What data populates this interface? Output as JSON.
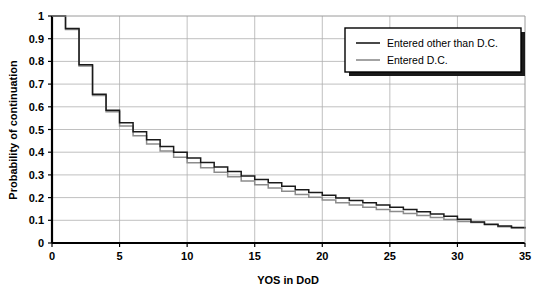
{
  "chart_data": {
    "type": "line",
    "title": "",
    "subtitle": "",
    "xlabel": "YOS in DoD",
    "ylabel": "Probability of continuation",
    "xlim": [
      0,
      35
    ],
    "ylim": [
      0,
      1
    ],
    "xticks": [
      0,
      5,
      10,
      15,
      20,
      25,
      30,
      35
    ],
    "xtick_labels": [
      "0",
      "5",
      "10",
      "15",
      "20",
      "25",
      "30",
      "35"
    ],
    "yticks": [
      0,
      0.1,
      0.2,
      0.3,
      0.4,
      0.5,
      0.6,
      0.7,
      0.8,
      0.9,
      1
    ],
    "ytick_labels": [
      "0",
      "0.1",
      "0.2",
      "0.3",
      "0.4",
      "0.5",
      "0.6",
      "0.7",
      "0.8",
      "0.9",
      "1"
    ],
    "grid": true,
    "grid_axis": "both",
    "grid_color": "#b0b0b0",
    "plot_style": "step-post",
    "legend": {
      "position": "top-right",
      "border": true,
      "shadow": true,
      "entries": [
        {
          "label": "Entered other than D.C.",
          "color": "#1a1a1a"
        },
        {
          "label": "Entered D.C.",
          "color": "#8c8c8c"
        }
      ]
    },
    "x": [
      0,
      1,
      2,
      3,
      4,
      5,
      6,
      7,
      8,
      9,
      10,
      11,
      12,
      13,
      14,
      15,
      16,
      17,
      18,
      19,
      20,
      21,
      22,
      23,
      24,
      25,
      26,
      27,
      28,
      29,
      30,
      31,
      32,
      33,
      34,
      35
    ],
    "series": [
      {
        "name": "Entered other than D.C.",
        "color": "#1a1a1a",
        "values": [
          1.0,
          0.945,
          0.785,
          0.655,
          0.585,
          0.53,
          0.49,
          0.455,
          0.425,
          0.4,
          0.375,
          0.355,
          0.335,
          0.315,
          0.295,
          0.28,
          0.265,
          0.25,
          0.235,
          0.222,
          0.21,
          0.198,
          0.187,
          0.177,
          0.167,
          0.157,
          0.148,
          0.138,
          0.128,
          0.118,
          0.105,
          0.093,
          0.083,
          0.075,
          0.068,
          0.065
        ]
      },
      {
        "name": "Entered D.C.",
        "color": "#8c8c8c",
        "values": [
          1.0,
          0.94,
          0.78,
          0.65,
          0.578,
          0.515,
          0.472,
          0.436,
          0.405,
          0.378,
          0.353,
          0.332,
          0.312,
          0.292,
          0.273,
          0.257,
          0.242,
          0.228,
          0.214,
          0.201,
          0.189,
          0.177,
          0.167,
          0.157,
          0.148,
          0.139,
          0.13,
          0.121,
          0.112,
          0.103,
          0.095,
          0.09,
          0.08,
          0.072,
          0.066,
          0.062
        ]
      }
    ]
  },
  "axes": {
    "x_title": "YOS in DoD",
    "y_title": "Probability of continuation"
  }
}
